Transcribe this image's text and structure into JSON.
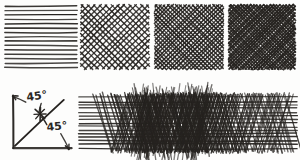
{
  "sheet": {
    "title": "Pen hatching technique sheet",
    "medium": "ink-on-paper",
    "background_color": "#fdfdfc",
    "ink_color": "#262320"
  },
  "swatches": [
    {
      "index": 1,
      "name": "horizontal-parallel-hatching",
      "label": "",
      "x": 6,
      "y": 6,
      "width": 70,
      "height": 62,
      "line_count": 14,
      "layers": [
        {
          "angle_deg": 0,
          "spacing_px": 4.4,
          "stroke_width": 1.5,
          "opacity": 0.92
        }
      ],
      "density": "light",
      "tone_value": 0.25
    },
    {
      "index": 2,
      "name": "diagonal-crosshatching",
      "label": "",
      "x": 82,
      "y": 6,
      "width": 66,
      "height": 62,
      "line_count": 34,
      "layers": [
        {
          "angle_deg": 45,
          "spacing_px": 4.2,
          "stroke_width": 1.4,
          "opacity": 0.9
        },
        {
          "angle_deg": -45,
          "spacing_px": 4.2,
          "stroke_width": 1.4,
          "opacity": 0.9
        }
      ],
      "density": "medium",
      "tone_value": 0.5
    },
    {
      "index": 3,
      "name": "dense-crosshatching",
      "label": "",
      "x": 156,
      "y": 6,
      "width": 66,
      "height": 62,
      "line_count": 56,
      "layers": [
        {
          "angle_deg": 45,
          "spacing_px": 2.9,
          "stroke_width": 1.5,
          "opacity": 0.92
        },
        {
          "angle_deg": -45,
          "spacing_px": 2.9,
          "stroke_width": 1.5,
          "opacity": 0.92
        }
      ],
      "density": "dark",
      "tone_value": 0.7
    },
    {
      "index": 4,
      "name": "very-dense-crosshatching",
      "label": "",
      "x": 230,
      "y": 6,
      "width": 64,
      "height": 62,
      "line_count": 76,
      "layers": [
        {
          "angle_deg": 45,
          "spacing_px": 2.3,
          "stroke_width": 1.7,
          "opacity": 0.95
        },
        {
          "angle_deg": -45,
          "spacing_px": 2.3,
          "stroke_width": 1.7,
          "opacity": 0.95
        }
      ],
      "density": "very-dark",
      "tone_value": 0.85
    }
  ],
  "angle_diagram": {
    "name": "forty-five-degree-angle-diagram",
    "x": 10,
    "y": 92,
    "width": 66,
    "height": 60,
    "vertical_axis": {
      "x1": 13,
      "y1": 95,
      "x2": 13,
      "y2": 148
    },
    "horizontal_axis": {
      "x1": 13,
      "y1": 148,
      "x2": 72,
      "y2": 148
    },
    "diagonal_line": {
      "x1": 15,
      "y1": 146,
      "x2": 64,
      "y2": 100
    },
    "tick_mark": {
      "cx": 40,
      "cy": 114,
      "length": 13,
      "angle_deg": -45
    },
    "labels": [
      {
        "id": "angle-label-upper",
        "text": "45°",
        "x": 27,
        "y": 101,
        "rotation_deg": -8,
        "arrow": {
          "from_x": 26,
          "from_y": 102,
          "to_x": 13,
          "to_y": 96,
          "head": "arrow-up-left"
        },
        "leader": {
          "from_x": 41,
          "from_y": 103,
          "to_x": 39,
          "to_y": 112
        }
      },
      {
        "id": "angle-label-lower",
        "text": "45°",
        "x": 47,
        "y": 131,
        "rotation_deg": -6,
        "arrow": {
          "from_x": 61,
          "from_y": 134,
          "to_x": 69,
          "to_y": 149,
          "head": "arrow-down-right"
        },
        "leader": {
          "from_x": 47,
          "from_y": 125,
          "to_x": 42,
          "to_y": 117
        }
      }
    ]
  },
  "gradient_band": {
    "name": "tone-gradient-hatching-band",
    "label": "",
    "x": 80,
    "y": 96,
    "width": 216,
    "height": 54,
    "description": "horizontal strokes across the full band with overlaid crosshatch that builds from left, peaks near 40% and fades to the right",
    "base_layer": {
      "angle_deg": 0,
      "line_count": 15,
      "spacing_px": 3.6,
      "stroke_width": 1.4
    },
    "overlay_layers": [
      {
        "angle_deg": 60,
        "start_fraction": 0.1,
        "peak_fraction": 0.42,
        "end_fraction": 1.0
      },
      {
        "angle_deg": -60,
        "start_fraction": 0.18,
        "peak_fraction": 0.42,
        "end_fraction": 0.95
      }
    ],
    "peak_darkness_fraction": 0.42,
    "min_tone": 0.15,
    "max_tone": 0.92
  }
}
